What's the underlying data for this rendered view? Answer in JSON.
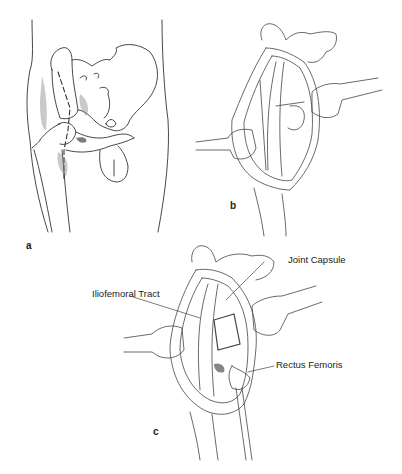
{
  "figure": {
    "panels": [
      {
        "id": "a",
        "letter": "a",
        "description": "Anterior view of hip and pelvis with dashed incision line"
      },
      {
        "id": "b",
        "letter": "b",
        "description": "Surgical exposure with two retractors"
      },
      {
        "id": "c",
        "letter": "c",
        "description": "Deep exposure showing hip joint capsule"
      }
    ],
    "labels": {
      "joint_capsule": "Joint Capsule",
      "iliofemoral_tract": "Iliofemoral Tract",
      "rectus_femoris": "Rectus Femoris"
    },
    "colors": {
      "line": "#333333",
      "shade": "#777777",
      "background": "#ffffff"
    }
  }
}
